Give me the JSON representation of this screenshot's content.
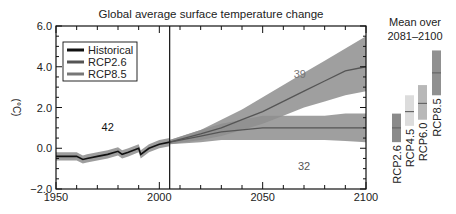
{
  "chart_data": {
    "type": "line",
    "title": "Global average surface temperature change",
    "xlabel": "",
    "ylabel": "(°C)",
    "xlim": [
      1950,
      2100
    ],
    "ylim": [
      -2.0,
      6.0
    ],
    "x_ticks": [
      "1950",
      "2000",
      "2050",
      "2100"
    ],
    "y_ticks": [
      "6.0",
      "4.0",
      "2.0",
      "0.0",
      "−2.0"
    ],
    "grid": false,
    "legend_position": "upper left",
    "legend": [
      "Historical",
      "RCP2.6",
      "RCP8.5"
    ],
    "vertical_marker_x": 2005,
    "series": [
      {
        "name": "Historical",
        "color": "#111111",
        "x": [
          1950,
          1955,
          1960,
          1963,
          1965,
          1970,
          1975,
          1980,
          1982,
          1985,
          1990,
          1991,
          1995,
          2000,
          2005
        ],
        "values": [
          -0.4,
          -0.4,
          -0.4,
          -0.55,
          -0.5,
          -0.4,
          -0.3,
          -0.15,
          -0.3,
          -0.2,
          0.0,
          -0.3,
          0.0,
          0.2,
          0.3
        ],
        "band": [
          0.2,
          0.2
        ],
        "model_count": "42"
      },
      {
        "name": "RCP2.6",
        "color": "#555555",
        "x": [
          2005,
          2020,
          2030,
          2040,
          2050,
          2060,
          2070,
          2080,
          2090,
          2100
        ],
        "values": [
          0.3,
          0.6,
          0.8,
          0.9,
          1.0,
          1.0,
          1.0,
          1.0,
          1.0,
          1.0
        ],
        "band_lower": [
          0.2,
          0.3,
          0.4,
          0.4,
          0.4,
          0.4,
          0.4,
          0.4,
          0.35,
          0.3
        ],
        "band_upper": [
          0.4,
          0.9,
          1.2,
          1.4,
          1.6,
          1.6,
          1.6,
          1.6,
          1.7,
          1.7
        ],
        "model_count": "32"
      },
      {
        "name": "RCP8.5",
        "color": "#555555",
        "x": [
          2005,
          2020,
          2030,
          2040,
          2050,
          2060,
          2070,
          2080,
          2090,
          2100
        ],
        "values": [
          0.3,
          0.7,
          1.0,
          1.4,
          1.8,
          2.3,
          2.8,
          3.3,
          3.8,
          4.0
        ],
        "band_lower": [
          0.2,
          0.4,
          0.6,
          0.9,
          1.2,
          1.6,
          2.0,
          2.3,
          2.6,
          2.8
        ],
        "band_upper": [
          0.4,
          0.9,
          1.4,
          1.9,
          2.5,
          3.1,
          3.7,
          4.3,
          4.9,
          5.5
        ],
        "model_count": "39"
      }
    ],
    "side_panel": {
      "title_line1": "Mean over",
      "title_line2": "2081–2100",
      "bars": [
        {
          "name": "RCP2.6",
          "low": 0.3,
          "mean": 1.0,
          "high": 1.7,
          "color": "#8a8a8a"
        },
        {
          "name": "RCP4.5",
          "low": 1.1,
          "mean": 1.8,
          "high": 2.6,
          "color": "#dcdcdc"
        },
        {
          "name": "RCP6.0",
          "low": 1.4,
          "mean": 2.2,
          "high": 3.1,
          "color": "#b8b8b8"
        },
        {
          "name": "RCP8.5",
          "low": 2.6,
          "mean": 3.7,
          "high": 4.8,
          "color": "#909090"
        }
      ]
    }
  }
}
